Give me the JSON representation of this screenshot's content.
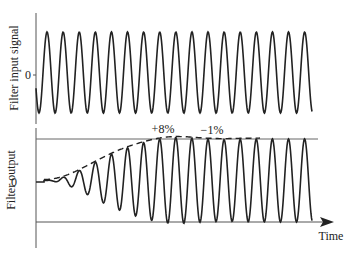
{
  "diagram": {
    "top_panel": {
      "ylabel": "Filter input signal",
      "zero_label": "0"
    },
    "bottom_panel": {
      "ylabel": "Filter output",
      "zero_label": "0",
      "overshoot_label": "+8%",
      "undershoot_label": "−1%",
      "xlabel": "Time"
    },
    "colors": {
      "line": "#222222",
      "axis": "#555555",
      "reference": "#666666"
    }
  }
}
